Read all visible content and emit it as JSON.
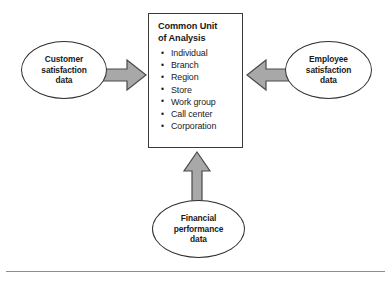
{
  "diagram": {
    "center": {
      "heading": "Common Unit\nof Analysis",
      "items": [
        "Individual",
        "Branch",
        "Region",
        "Store",
        "Work group",
        "Call center",
        "Corporation"
      ]
    },
    "sources": {
      "left": "Customer\nsatisfaction\ndata",
      "right": "Employee\nsatisfaction\ndata",
      "bottom": "Financial\nperformance\ndata"
    },
    "arrows": {
      "left": "arrow-right-icon",
      "right": "arrow-left-icon",
      "bottom": "arrow-up-icon"
    },
    "colors": {
      "arrow_fill": "#a8a8a8",
      "arrow_stroke": "#4a4a4a",
      "box_border": "#3a3a3a",
      "ellipse_border": "#2e2e2e",
      "text": "#1a1a1a",
      "rule": "#8d8d8d",
      "background": "#ffffff"
    }
  }
}
